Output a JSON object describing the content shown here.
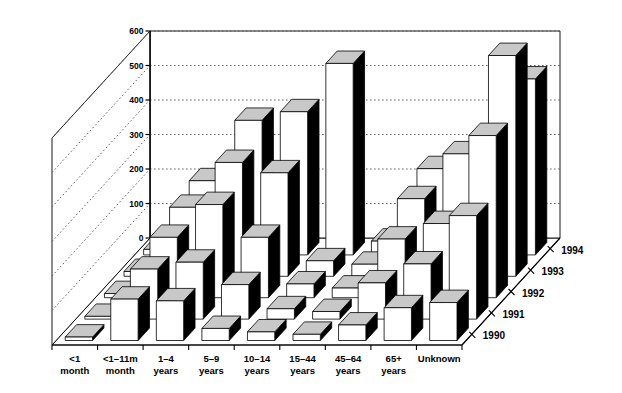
{
  "chart_data": {
    "type": "bar",
    "title": "",
    "subtitle": "",
    "xlabel": "",
    "ylabel": "",
    "zlabel": "",
    "projection": "3d",
    "grid": true,
    "legend_position": "depth-axis",
    "ylim": [
      0,
      600
    ],
    "yticks": [
      0,
      100,
      200,
      300,
      400,
      500,
      600
    ],
    "ytick_labels": [
      "0",
      "100",
      "200",
      "300",
      "400",
      "500",
      "600"
    ],
    "categories": [
      "<1\nmonth",
      "<1–11m\nmonth",
      "1–4\nyears",
      "5–9\nyears",
      "10–14\nyears",
      "15–44\nyears",
      "45–64\nyears",
      "65+\nyears",
      "Unknown"
    ],
    "category_lines": [
      [
        "<1",
        "month"
      ],
      [
        "<1–11m",
        "month"
      ],
      [
        "1–4",
        "years"
      ],
      [
        "5–9",
        "years"
      ],
      [
        "10–14",
        "years"
      ],
      [
        "15–44",
        "years"
      ],
      [
        "45–64",
        "years"
      ],
      [
        "65+",
        "years"
      ],
      [
        "Unknown",
        ""
      ]
    ],
    "depth_labels": [
      "1990",
      "1991",
      "1992",
      "1993",
      "1994"
    ],
    "series": [
      {
        "name": "1990",
        "values": [
          10,
          120,
          115,
          35,
          25,
          18,
          45,
          95,
          110
        ]
      },
      {
        "name": "1991",
        "values": [
          8,
          145,
          165,
          100,
          30,
          22,
          105,
          160,
          300
        ]
      },
      {
        "name": "1992",
        "values": [
          12,
          175,
          270,
          175,
          40,
          28,
          170,
          215,
          470
        ]
      },
      {
        "name": "1993",
        "values": [
          14,
          200,
          330,
          300,
          45,
          35,
          225,
          355,
          640
        ]
      },
      {
        "name": "1994",
        "values": [
          16,
          215,
          390,
          415,
          555,
          40,
          250,
          260,
          510
        ]
      }
    ],
    "colors": {
      "bar_front": "#ffffff",
      "bar_side": "#000000",
      "bar_top": "#c8c8c8",
      "outline": "#000000",
      "grid": "#555555",
      "axis": "#000000",
      "background": "#ffffff"
    }
  }
}
